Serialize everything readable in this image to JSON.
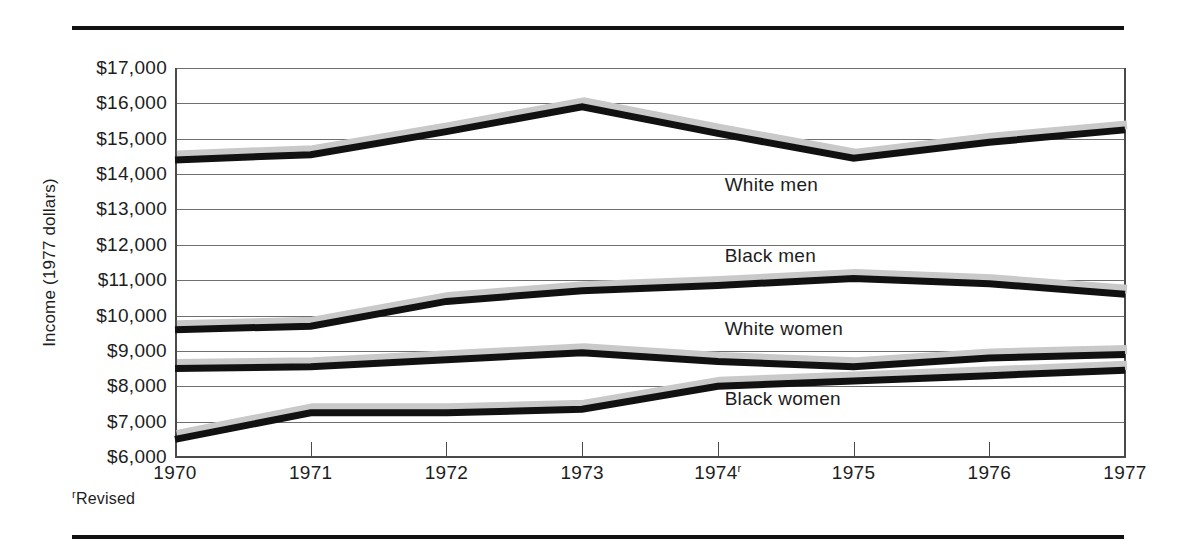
{
  "figure": {
    "footnote_marker": "r",
    "footnote_text": "Revised"
  },
  "chart_data": {
    "type": "line",
    "title": "",
    "xlabel": "",
    "ylabel": "Income (1977 dollars)",
    "x": [
      1970,
      1971,
      1972,
      1973,
      1974,
      1975,
      1976,
      1977
    ],
    "x_tick_labels": [
      "1970",
      "1971",
      "1972",
      "1973",
      "1974",
      "1975",
      "1976",
      "1977"
    ],
    "x_tick_superscripts": [
      "",
      "",
      "",
      "",
      "r",
      "",
      "",
      ""
    ],
    "y_tick_labels": [
      "$17,000",
      "$16,000",
      "$15,000",
      "$14,000",
      "$13,000",
      "$12,000",
      "$11,000",
      "$10,000",
      "$9,000",
      "$8,000",
      "$7,000",
      "$6,000"
    ],
    "y_tick_values": [
      17000,
      16000,
      15000,
      14000,
      13000,
      12000,
      11000,
      10000,
      9000,
      8000,
      7000,
      6000
    ],
    "ylim": [
      6000,
      17000
    ],
    "xlim": [
      1970,
      1977
    ],
    "grid": true,
    "legend_position": "inline-right",
    "line_color": "#111111",
    "shadow_color": "#c9c9c9",
    "gridline_color": "#6f6f6f",
    "series": [
      {
        "name": "White men",
        "label": "White men",
        "label_x": 1974.05,
        "label_y": 13650,
        "values": [
          14400,
          14550,
          15200,
          15900,
          15150,
          14450,
          14900,
          15250
        ]
      },
      {
        "name": "Black men",
        "label": "Black men",
        "label_x": 1974.05,
        "label_y": 11650,
        "values": [
          9600,
          9700,
          10400,
          10700,
          10850,
          11050,
          10900,
          10600
        ]
      },
      {
        "name": "White women",
        "label": "White women",
        "label_x": 1974.05,
        "label_y": 9600,
        "values": [
          8500,
          8550,
          8750,
          8950,
          8700,
          8550,
          8800,
          8900
        ]
      },
      {
        "name": "Black women",
        "label": "Black women",
        "label_x": 1974.05,
        "label_y": 7600,
        "values": [
          6500,
          7250,
          7250,
          7350,
          8000,
          8150,
          8300,
          8450
        ]
      }
    ]
  }
}
